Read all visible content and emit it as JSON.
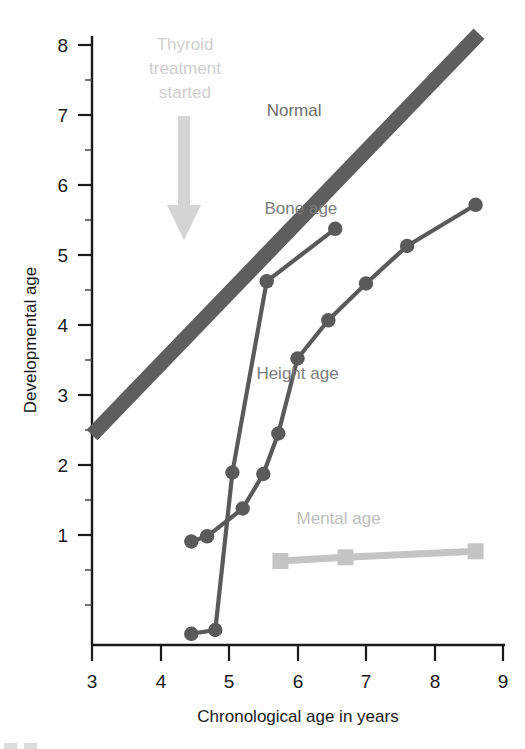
{
  "chart_data": {
    "type": "line",
    "title": "",
    "xlabel": "Chronological age in years",
    "ylabel": "Developmental age",
    "xlim": [
      3,
      9
    ],
    "ylim": [
      0,
      8.35
    ],
    "xticks": [
      3,
      4,
      5,
      6,
      7,
      8,
      9
    ],
    "xtick_labels": [
      "3",
      "4",
      "5",
      "6",
      "7",
      "8",
      "9"
    ],
    "yticks": [
      3,
      4,
      5,
      6,
      7,
      8
    ],
    "ytick_labels": [
      "3",
      "4",
      "5",
      "6",
      "7",
      "8"
    ],
    "yminorticks": [
      0.5,
      1,
      1.5,
      2,
      2.5,
      3.5,
      4.5,
      5.5,
      6.5,
      7.5
    ],
    "grid": false,
    "legend_position": "inline-labels",
    "annotations": [
      {
        "name": "thyroid-treatment-annotation",
        "text_lines": [
          "Thyroid",
          "treatment",
          "started"
        ],
        "arrow": "down",
        "x": 4.33,
        "y_from": 7.5,
        "y_to": 5.05,
        "color": "#d2d2d2"
      }
    ],
    "series": [
      {
        "name": "Normal",
        "label": "Normal",
        "style": "band",
        "color": "#5e5e5e",
        "marker": "none",
        "x": [
          3.0,
          8.65
        ],
        "y": [
          2.8,
          8.15
        ],
        "label_x": 5.95,
        "label_y": 7.05
      },
      {
        "name": "Bone age",
        "label": "Bone age",
        "style": "line",
        "color": "#5a5a5a",
        "marker": "circle",
        "x": [
          4.45,
          4.8,
          5.05,
          5.55,
          6.55
        ],
        "y": [
          0.15,
          0.2,
          2.3,
          4.85,
          5.55
        ],
        "label_x": 6.05,
        "label_y": 5.75
      },
      {
        "name": "Height age",
        "label": "Height age",
        "style": "line",
        "color": "#5a5a5a",
        "marker": "circle",
        "x": [
          4.45,
          4.68,
          5.2,
          5.5,
          5.72,
          6.0,
          6.45,
          7.0,
          7.6,
          8.6
        ],
        "y": [
          1.38,
          1.45,
          1.82,
          2.28,
          2.82,
          3.82,
          4.33,
          4.82,
          5.32,
          5.87
        ],
        "label_x": 6.0,
        "label_y": 3.55
      },
      {
        "name": "Mental age",
        "label": "Mental age",
        "style": "line",
        "color": "#c4c4c4",
        "marker": "square",
        "x": [
          5.75,
          6.7,
          8.6
        ],
        "y": [
          1.12,
          1.17,
          1.25
        ],
        "label_x": 6.6,
        "label_y": 1.62
      }
    ]
  },
  "axes": {
    "x_title": "Chronological age in years",
    "y_title": "Developmental age"
  },
  "colors": {
    "axis": "#1a1a1a",
    "normal_band": "#5e5e5e",
    "data_dark": "#5a5a5a",
    "mental_gray": "#c4c4c4",
    "annotation_gray": "#d2d2d2",
    "series_label": "#7d7d7d"
  }
}
